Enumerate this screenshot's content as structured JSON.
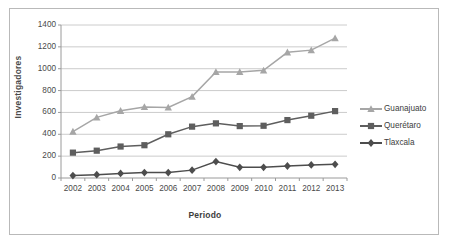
{
  "figure": {
    "title_fragment": "g",
    "axis_label_y": "Investigadores",
    "axis_label_x": "Periodo"
  },
  "colors": {
    "guanajuato": "#a6a6a6",
    "queretaro": "#5e5e5e",
    "tlaxcala": "#4d4d4d",
    "grid": "#c6c6c6",
    "axis": "#9a9a9a",
    "text": "#4a4a4a",
    "frame": "#b9b9b9"
  },
  "legend": {
    "position": "right",
    "entries": [
      {
        "label": "Guanajuato",
        "marker": "triangle",
        "color": "#a6a6a6"
      },
      {
        "label": "Querétaro",
        "marker": "square",
        "color": "#5e5e5e"
      },
      {
        "label": "Tlaxcala",
        "marker": "diamond",
        "color": "#4d4d4d"
      }
    ]
  },
  "chart_data": {
    "type": "line",
    "title": "",
    "xlabel": "Periodo",
    "ylabel": "Investigadores",
    "categories": [
      "2002",
      "2003",
      "2004",
      "2005",
      "2006",
      "2007",
      "2008",
      "2009",
      "2010",
      "2011",
      "2012",
      "2013"
    ],
    "x": [
      2002,
      2003,
      2004,
      2005,
      2006,
      2007,
      2008,
      2009,
      2010,
      2011,
      2012,
      2013
    ],
    "ylim": [
      0,
      1400
    ],
    "yticks": [
      0,
      200,
      400,
      600,
      800,
      1000,
      1200,
      1400
    ],
    "ytick_labels": [
      "0",
      "200",
      "400",
      "600",
      "800",
      "1000",
      "1200",
      "1400"
    ],
    "grid": true,
    "legend_position": "right",
    "series": [
      {
        "name": "Guanajuato",
        "marker": "triangle",
        "color": "#a6a6a6",
        "values": [
          425,
          555,
          615,
          650,
          645,
          745,
          970,
          970,
          985,
          1150,
          1170,
          1280
        ]
      },
      {
        "name": "Querétaro",
        "marker": "square",
        "color": "#5e5e5e",
        "values": [
          232,
          250,
          288,
          300,
          400,
          470,
          500,
          475,
          478,
          530,
          570,
          612
        ]
      },
      {
        "name": "Tlaxcala",
        "marker": "diamond",
        "color": "#4d4d4d",
        "values": [
          22,
          30,
          42,
          50,
          50,
          72,
          150,
          98,
          98,
          110,
          120,
          125
        ]
      }
    ]
  }
}
